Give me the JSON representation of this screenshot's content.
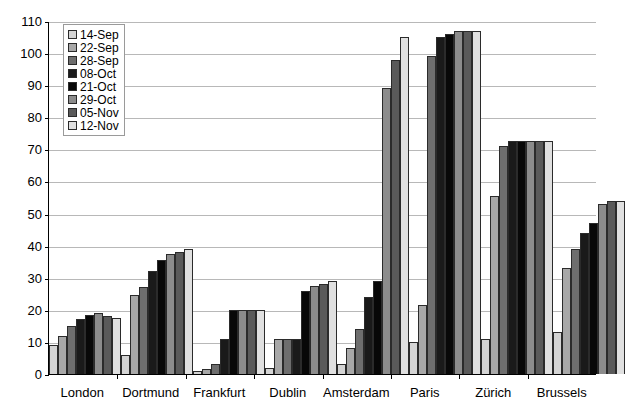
{
  "chart_data": {
    "type": "bar",
    "title": "",
    "subtitle": "",
    "xlabel": "",
    "ylabel": "",
    "ylim": [
      0,
      110
    ],
    "ytick_step": 10,
    "yticks": [
      0,
      10,
      20,
      30,
      40,
      50,
      60,
      70,
      80,
      90,
      100,
      110
    ],
    "grid": true,
    "legend_position": "top-left inside plot",
    "categories": [
      "London",
      "Dortmund",
      "Frankfurt",
      "Dublin",
      "Amsterdam",
      "Paris",
      "Zürich",
      "Brussels"
    ],
    "series": [
      {
        "name": "14-Sep",
        "color": "#d4d4d4",
        "values": [
          9,
          6,
          1,
          2,
          3,
          10,
          11,
          13
        ]
      },
      {
        "name": "22-Sep",
        "color": "#a8a8a8",
        "values": [
          12,
          24.5,
          1.5,
          11,
          8,
          21.5,
          55.5,
          33
        ]
      },
      {
        "name": "28-Sep",
        "color": "#6e6e6e",
        "values": [
          15,
          27,
          3,
          11,
          14,
          99,
          71,
          39
        ]
      },
      {
        "name": "08-Oct",
        "color": "#1a1a1a",
        "values": [
          17,
          32,
          11,
          11,
          24,
          105,
          72.5,
          44
        ]
      },
      {
        "name": "21-Oct",
        "color": "#080808",
        "values": [
          18.5,
          35.5,
          20,
          26,
          29,
          106,
          72.5,
          47
        ]
      },
      {
        "name": "29-Oct",
        "color": "#8c8c8c",
        "values": [
          19,
          37.5,
          20,
          27.5,
          89,
          107,
          72.5,
          53
        ]
      },
      {
        "name": "05-Nov",
        "color": "#5a5a5a",
        "values": [
          18,
          38,
          20,
          28,
          98,
          107,
          72.5,
          54
        ]
      },
      {
        "name": "12-Nov",
        "color": "#e0e0e0",
        "values": [
          17.5,
          39,
          20,
          29,
          105,
          107,
          72.5,
          54
        ]
      }
    ]
  }
}
